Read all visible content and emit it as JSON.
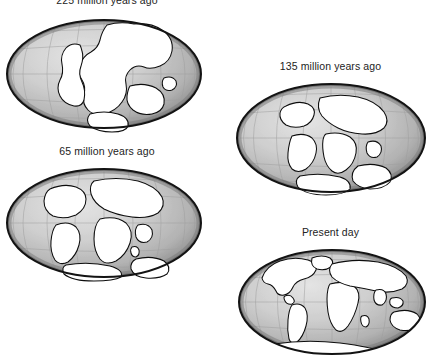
{
  "figure": {
    "projection": "Mollweide oval world projection",
    "panel_count": 4,
    "background_color": "#ffffff",
    "ocean_color": "#b9b9b9",
    "land_color": "#ffffff",
    "outline_color": "#0d0d0d",
    "graticule_color": "#9a9a9a",
    "rim_color": "#1a1a1a",
    "caption_color": "#232323"
  },
  "panels": [
    {
      "id": "panel-225ma",
      "caption": "225 million years ago",
      "caption_clipped_at_top": true,
      "stage_name": "Pangaea",
      "landmass_description": "single supercontinent, all continents joined near center",
      "box": {
        "x": 4,
        "y": -2,
        "w": 206,
        "h": 148
      },
      "ellipse": {
        "cx": 104,
        "cy": 76,
        "rx": 97,
        "ry": 54
      }
    },
    {
      "id": "panel-135ma",
      "caption": "135 million years ago",
      "stage_name": "Laurasia and Gondwana separating",
      "landmass_description": "northern and southern landmasses split, Atlantic opening",
      "box": {
        "x": 228,
        "y": 60,
        "w": 205,
        "h": 148
      },
      "ellipse": {
        "cx": 334,
        "cy": 142,
        "rx": 94,
        "ry": 54
      }
    },
    {
      "id": "panel-65ma",
      "caption": "65 million years ago",
      "stage_name": "Continents drifting apart",
      "landmass_description": "Africa and South America separated, India moving north",
      "box": {
        "x": 4,
        "y": 145,
        "w": 206,
        "h": 148
      },
      "ellipse": {
        "cx": 104,
        "cy": 226,
        "rx": 97,
        "ry": 54
      }
    },
    {
      "id": "panel-present",
      "caption": "Present day",
      "stage_name": "Modern configuration",
      "landmass_description": "continents in present-day positions",
      "box": {
        "x": 228,
        "y": 226,
        "w": 205,
        "h": 132
      },
      "ellipse": {
        "cx": 336,
        "cy": 303,
        "rx": 93,
        "ry": 52
      }
    }
  ]
}
